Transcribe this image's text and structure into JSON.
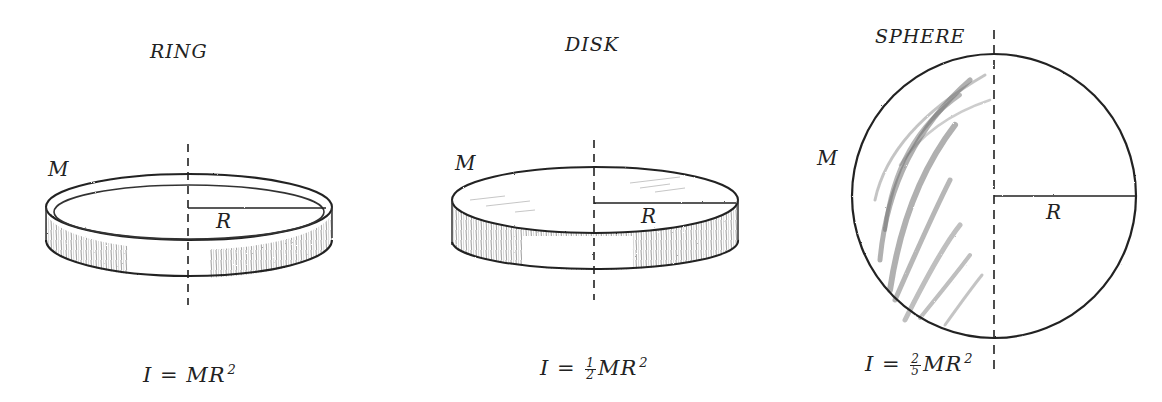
{
  "diagram": {
    "topic": "Moments of inertia",
    "panels": [
      {
        "id": "ring",
        "title": "RING",
        "mass_label": "M",
        "radius_label": "R",
        "formula": {
          "lhs": "I",
          "eq": "=",
          "coef_num": "",
          "coef_den": "",
          "body": "MR",
          "exp": "2"
        }
      },
      {
        "id": "disk",
        "title": "DISK",
        "mass_label": "M",
        "radius_label": "R",
        "formula": {
          "lhs": "I",
          "eq": "=",
          "coef_num": "1",
          "coef_den": "2",
          "body": "MR",
          "exp": "2"
        }
      },
      {
        "id": "sphere",
        "title": "SPHERE",
        "mass_label": "M",
        "radius_label": "R",
        "formula": {
          "lhs": "I",
          "eq": "=",
          "coef_num": "2",
          "coef_den": "5",
          "body": "MR",
          "exp": "2"
        }
      }
    ],
    "colors": {
      "ink": "#222222",
      "shade": "#555555",
      "background": "#ffffff"
    }
  }
}
